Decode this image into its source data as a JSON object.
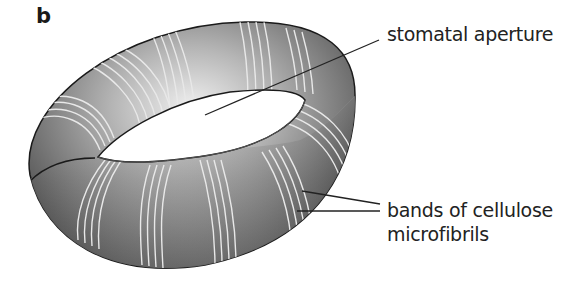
{
  "figure": {
    "panel_label": "b",
    "labels": {
      "aperture": "stomatal aperture",
      "bands_line1": "bands of cellulose",
      "bands_line2": "microfibrils"
    },
    "colors": {
      "torus_dark": "#3a3a3a",
      "torus_mid": "#8a8a8a",
      "torus_light": "#e6e6e6",
      "bands": "#e8e8e8",
      "outline": "#1a1a1a",
      "leader_lines": "#222222"
    }
  }
}
